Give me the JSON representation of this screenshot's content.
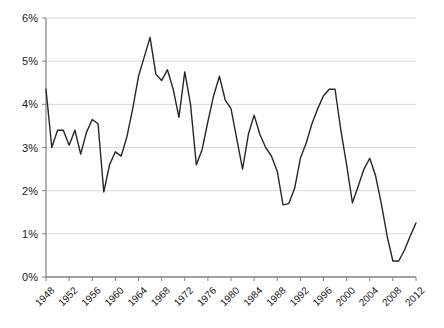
{
  "chart_data": {
    "type": "line",
    "title": "",
    "subtitle": "",
    "xlabel": "",
    "ylabel": "",
    "grid": true,
    "legend": "none",
    "xlim": [
      1948,
      2012
    ],
    "ylim": [
      0,
      6
    ],
    "ytick_labels": [
      "0%",
      "1%",
      "2%",
      "3%",
      "4%",
      "5%",
      "6%"
    ],
    "ytick_values": [
      0,
      1,
      2,
      3,
      4,
      5,
      6
    ],
    "xtick_labels": [
      "1948",
      "1952",
      "1956",
      "1960",
      "1964",
      "1968",
      "1972",
      "1976",
      "1980",
      "1984",
      "1988",
      "1992",
      "1996",
      "2000",
      "2004",
      "2008",
      "2012"
    ],
    "xtick_values": [
      1948,
      1952,
      1956,
      1960,
      1964,
      1968,
      1972,
      1976,
      1980,
      1984,
      1988,
      1992,
      1996,
      2000,
      2004,
      2008,
      2012
    ],
    "line_color": "#262626",
    "line_width": 1.4,
    "grid_color": "#d9d9d9",
    "axis_color": "#808080",
    "x": [
      1948,
      1949,
      1950,
      1951,
      1952,
      1953,
      1954,
      1955,
      1956,
      1957,
      1958,
      1959,
      1960,
      1961,
      1962,
      1963,
      1964,
      1965,
      1966,
      1967,
      1968,
      1969,
      1970,
      1971,
      1972,
      1973,
      1974,
      1975,
      1976,
      1977,
      1978,
      1979,
      1980,
      1981,
      1982,
      1983,
      1984,
      1985,
      1986,
      1987,
      1988,
      1989,
      1990,
      1991,
      1992,
      1993,
      1994,
      1995,
      1996,
      1997,
      1998,
      1999,
      2000,
      2001,
      2002,
      2003,
      2004,
      2005,
      2006,
      2007,
      2008,
      2009,
      2010,
      2011,
      2012
    ],
    "values": [
      4.35,
      3.0,
      3.4,
      3.4,
      3.05,
      3.4,
      2.85,
      3.35,
      3.65,
      3.55,
      1.97,
      2.6,
      2.9,
      2.8,
      3.25,
      3.9,
      4.65,
      5.1,
      5.55,
      4.7,
      4.55,
      4.8,
      4.35,
      3.7,
      4.75,
      4.0,
      2.6,
      2.95,
      3.6,
      4.2,
      4.65,
      4.1,
      3.9,
      3.2,
      2.5,
      3.3,
      3.75,
      3.3,
      3.0,
      2.8,
      2.45,
      1.67,
      1.7,
      2.05,
      2.75,
      3.1,
      3.55,
      3.9,
      4.2,
      4.35,
      4.35,
      3.4,
      2.6,
      1.72,
      2.1,
      2.5,
      2.75,
      2.35,
      1.7,
      0.95,
      0.37,
      0.37,
      0.62,
      0.95,
      1.25
    ]
  },
  "axes": {
    "y_axis_name": "percent-axis",
    "x_axis_name": "year-axis"
  }
}
